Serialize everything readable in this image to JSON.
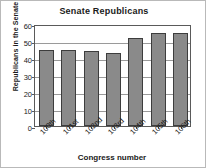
{
  "chart_data": {
    "type": "bar",
    "title": "Senate Republicans",
    "xlabel": "Congress number",
    "ylabel": "Republicans in the Senate",
    "categories": [
      "100th",
      "101st",
      "102nd",
      "103rd",
      "104th",
      "105th",
      "106th"
    ],
    "values": [
      45,
      45,
      44,
      43,
      52,
      55,
      55
    ],
    "ylim": [
      0,
      60
    ],
    "yticks": [
      0,
      10,
      20,
      30,
      40,
      50,
      60
    ],
    "ytick_labels": [
      "0",
      "10",
      "20",
      "30",
      "40",
      "50",
      "60"
    ],
    "grid": true,
    "legend": null,
    "bar_color": "#8a8a8a",
    "bar_border_color": "#3d3d3d",
    "axis_color": "#5a5a5a",
    "grid_color": "#9a9a9a",
    "background": "#ffffff",
    "frame_border_color": "#b9b9b9"
  }
}
